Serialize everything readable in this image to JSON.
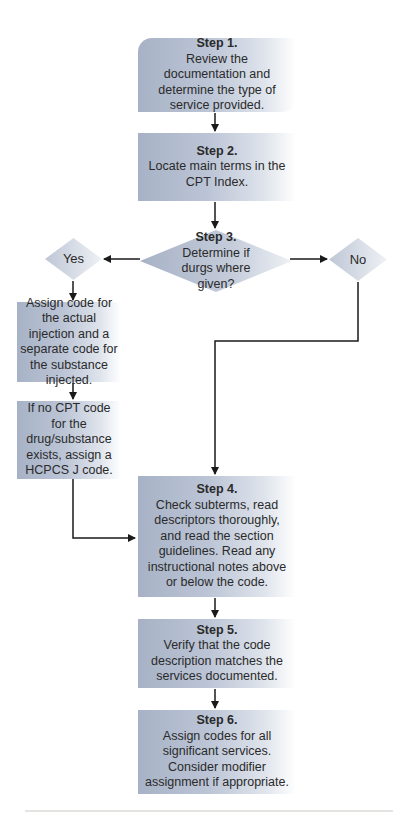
{
  "flowchart": {
    "step1": {
      "title": "Step 1.",
      "text": "Review the documentation and determine the type of service provided."
    },
    "step2": {
      "title": "Step 2.",
      "text": "Locate main terms in the CPT Index."
    },
    "step3": {
      "title": "Step 3.",
      "text": "Determine if durgs where given?"
    },
    "yes": {
      "label": "Yes"
    },
    "no": {
      "label": "No"
    },
    "yes_branch": [
      {
        "text": "Assign code for the actual injection and a separate code for the substance injected."
      },
      {
        "text": "If no CPT code for the drug/substance exists, assign a HCPCS J code."
      }
    ],
    "step4": {
      "title": "Step 4.",
      "text": "Check subterms, read descriptors thoroughly, and read the section guidelines. Read any instructional notes above or below the code."
    },
    "step5": {
      "title": "Step 5.",
      "text": "Verify that the code description matches the services documented."
    },
    "step6": {
      "title": "Step 6.",
      "text": "Assign codes for all significant services. Consider modifier assignment if appropriate."
    }
  },
  "colors": {
    "box_fill_start": "#a7b2c6",
    "box_fill_end": "#ffffff",
    "arrow": "#1a1a1a"
  }
}
